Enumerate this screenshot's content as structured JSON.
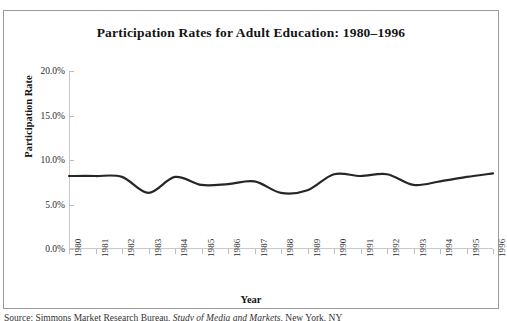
{
  "chart_data": {
    "type": "line",
    "title": "Participation Rates for Adult Education: 1980–1996",
    "xlabel": "Year",
    "ylabel": "Participation Rate",
    "categories": [
      "1980",
      "1981",
      "1982",
      "1983",
      "1984",
      "1985",
      "1986",
      "1987",
      "1988",
      "1989",
      "1990",
      "1991",
      "1992",
      "1993",
      "1994",
      "1995",
      "1996"
    ],
    "x": [
      1980,
      1981,
      1982,
      1983,
      1984,
      1985,
      1986,
      1987,
      1988,
      1989,
      1990,
      1991,
      1992,
      1993,
      1994,
      1995,
      1996
    ],
    "values": [
      8.2,
      8.2,
      8.1,
      6.3,
      8.1,
      7.2,
      7.3,
      7.6,
      6.3,
      6.6,
      8.4,
      8.2,
      8.4,
      7.2,
      7.6,
      8.1,
      8.5
    ],
    "series": [
      {
        "name": "Participation Rate",
        "values": [
          8.2,
          8.2,
          8.1,
          6.3,
          8.1,
          7.2,
          7.3,
          7.6,
          6.3,
          6.6,
          8.4,
          8.2,
          8.4,
          7.2,
          7.6,
          8.1,
          8.5
        ]
      }
    ],
    "ylim": [
      0.0,
      20.0
    ],
    "ytick_values": [
      0.0,
      5.0,
      10.0,
      15.0,
      20.0
    ],
    "ytick_labels": [
      "0.0%",
      "5.0%",
      "10.0%",
      "15.0%",
      "20.0%"
    ],
    "xlim": [
      1980,
      1996
    ],
    "grid": false,
    "legend": null,
    "legend_position": "none",
    "line_color": "#262626",
    "line_width": 2.2,
    "markers": false,
    "smoothing": "spline"
  },
  "figure": {
    "title": "Participation Rates for Adult Education: 1980–1996",
    "axis_title_y": "Participation Rate",
    "axis_title_x": "Year",
    "border_color": "#9a9a9a",
    "axis_color": "#c8c8c8",
    "background": "#ffffff"
  },
  "source_note": {
    "prefix": "Source: Simmons Market Research Bureau, ",
    "italic": "Study of Media and Markets,",
    "suffix": " New York, NY"
  }
}
